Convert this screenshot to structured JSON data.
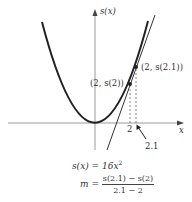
{
  "diagram": {
    "axes": {
      "y_label": "s(x)",
      "x_label": "x"
    },
    "ticks": {
      "x1": "2",
      "x2": "2.1"
    },
    "points": [
      {
        "label": "(2, s(2))",
        "x": 2
      },
      {
        "label": "(2, s(2.1))",
        "x": 2.1
      }
    ],
    "curve": {
      "equation": "s(x) = 16x^2",
      "type": "parabola"
    },
    "formulas": {
      "function_lhs": "s(x) = 16x",
      "function_exp": "2",
      "slope_lhs": "m =",
      "slope_numerator": "s(2.1) − s(2)",
      "slope_denominator": "2.1 − 2"
    },
    "colors": {
      "curve": "#222222",
      "axes": "#999999",
      "secant": "#333333",
      "dashed": "#666666"
    }
  }
}
